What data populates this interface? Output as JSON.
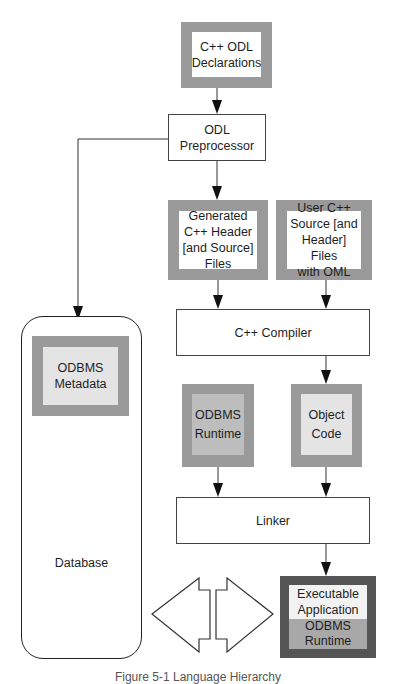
{
  "diagram": {
    "nodes": {
      "odl_declarations": {
        "line1": "C++ ODL",
        "line2": "Declarations"
      },
      "odl_preprocessor": {
        "line1": "ODL",
        "line2": "Preprocessor"
      },
      "generated_header": {
        "line1": "Generated",
        "line2": "C++ Header",
        "line3": "[and Source]",
        "line4": "Files"
      },
      "user_source": {
        "line1": "User C++",
        "line2": "Source [and",
        "line3": "Header] Files",
        "line4": "with OML"
      },
      "cpp_compiler": {
        "label": "C++ Compiler"
      },
      "odbms_metadata": {
        "line1": "ODBMS",
        "line2": "Metadata"
      },
      "odbms_runtime": {
        "line1": "ODBMS",
        "line2": "Runtime"
      },
      "object_code": {
        "line1": "Object",
        "line2": "Code"
      },
      "linker": {
        "label": "Linker"
      },
      "database": {
        "label": "Database"
      },
      "executable": {
        "top_line1": "Executable",
        "top_line2": "Application",
        "bottom_line1": "ODBMS",
        "bottom_line2": "Runtime"
      }
    },
    "edges": [
      {
        "from": "odl_declarations",
        "to": "odl_preprocessor"
      },
      {
        "from": "odl_preprocessor",
        "to": "generated_header"
      },
      {
        "from": "odl_preprocessor",
        "to": "odbms_metadata"
      },
      {
        "from": "generated_header",
        "to": "cpp_compiler"
      },
      {
        "from": "user_source",
        "to": "cpp_compiler"
      },
      {
        "from": "cpp_compiler",
        "to": "object_code"
      },
      {
        "from": "odbms_runtime",
        "to": "linker"
      },
      {
        "from": "object_code",
        "to": "linker"
      },
      {
        "from": "linker",
        "to": "executable"
      },
      {
        "from": "database",
        "to": "executable",
        "bidirectional": true
      }
    ],
    "colors": {
      "frame": "#9a9a9a",
      "light_fill": "#e4e4e4",
      "mid_fill": "#bdbdbd",
      "exe_frame": "#555555",
      "line": "#222222"
    }
  },
  "caption": "Figure 5-1  Language Hierarchy"
}
